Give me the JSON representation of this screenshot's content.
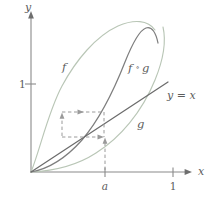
{
  "figure": {
    "background_color": "#ffffff"
  },
  "axes": {
    "x_label": "x",
    "y_label": "y",
    "x_ticks": [
      {
        "label": "a",
        "value": 0.52,
        "italic": true
      },
      {
        "label": "1",
        "value": 1.0,
        "italic": false
      }
    ],
    "y_ticks": [
      {
        "label": "1",
        "value": 1.0,
        "italic": false
      }
    ],
    "axis_color": "#8a8a8a",
    "origin_label": ""
  },
  "curves": [
    {
      "name": "f",
      "label": "f",
      "color": "#b9c6b6",
      "description": "upper-left concave curve rising steeply then arching over"
    },
    {
      "name": "g",
      "label": "g",
      "color": "#b9c6b6",
      "description": "lower-right convex curve rising slowly then steeply"
    },
    {
      "name": "fog",
      "label": "f ∘ g",
      "label_left": "f",
      "label_op": "∘",
      "label_right": "g",
      "color": "#7e7e7e",
      "description": "composition curve between f and g, peaks near top right"
    },
    {
      "name": "identity",
      "label": "y = x",
      "color": "#6b6b6b",
      "description": "straight diagonal identity line through origin"
    }
  ],
  "construction": {
    "dash_color": "#9a9a9a",
    "point_a": "a",
    "arrows": [
      {
        "name": "arrow-up-from-a",
        "direction": "up"
      },
      {
        "name": "arrow-right-lower",
        "direction": "right"
      },
      {
        "name": "arrow-up-left-vertical",
        "direction": "up"
      },
      {
        "name": "arrow-right-upper",
        "direction": "right"
      }
    ]
  }
}
